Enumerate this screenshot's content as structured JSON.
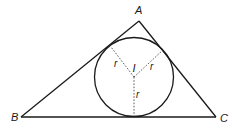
{
  "diagram": {
    "vertices": {
      "A": {
        "label": "A",
        "x": 139,
        "y": 21,
        "label_x": 135,
        "label_y": 14
      },
      "B": {
        "label": "B",
        "x": 21,
        "y": 117,
        "label_x": 11,
        "label_y": 121
      },
      "C": {
        "label": "C",
        "x": 216,
        "y": 117,
        "label_x": 220,
        "label_y": 122
      }
    },
    "incircle": {
      "center_label": "I",
      "cx": 134,
      "cy": 77,
      "r": 39.5,
      "center_label_x": 132.5,
      "center_label_y": 72
    },
    "radii": [
      {
        "label": "r",
        "to_x": 111,
        "to_y": 47,
        "label_x": 114,
        "label_y": 67
      },
      {
        "label": "r",
        "to_x": 163,
        "to_y": 50,
        "label_x": 150,
        "label_y": 70
      },
      {
        "label": "r",
        "to_x": 134,
        "to_y": 117,
        "label_x": 136,
        "label_y": 98
      }
    ],
    "colors": {
      "line": "#1a1a1a",
      "background": "#ffffff"
    }
  }
}
